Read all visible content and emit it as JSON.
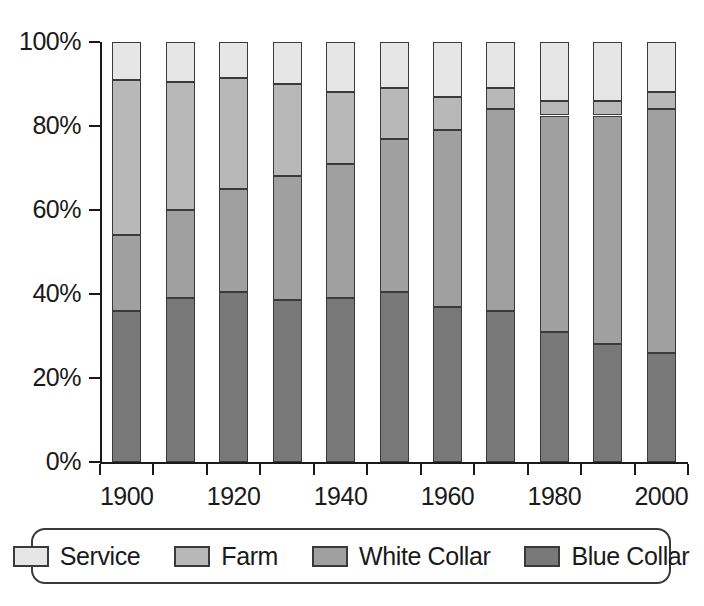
{
  "chart_data": {
    "type": "bar",
    "subtype": "stacked-100-percent",
    "title": "",
    "xlabel": "",
    "ylabel": "",
    "categories": [
      "1900",
      "1910",
      "1920",
      "1930",
      "1940",
      "1950",
      "1960",
      "1970",
      "1980",
      "1990",
      "2000"
    ],
    "x_tick_labels": [
      "1900",
      "",
      "1920",
      "",
      "1940",
      "",
      "1960",
      "",
      "1980",
      "",
      "2000"
    ],
    "y_tick_labels": [
      "0%",
      "20%",
      "40%",
      "60%",
      "80%",
      "100%"
    ],
    "y_tick_values": [
      0,
      20,
      40,
      60,
      80,
      100
    ],
    "ylim": [
      0,
      100
    ],
    "grid": false,
    "legend_position": "bottom",
    "stack_order_bottom_to_top": [
      "Blue Collar",
      "White Collar",
      "Farm",
      "Service"
    ],
    "series": [
      {
        "name": "Blue Collar",
        "color": "#787878",
        "values": [
          36,
          39,
          40.5,
          38.5,
          39,
          40.5,
          37,
          36,
          31,
          28,
          26
        ]
      },
      {
        "name": "White Collar",
        "color": "#a0a0a0",
        "values": [
          18,
          21,
          24.5,
          29.5,
          32,
          36.5,
          42,
          48,
          51.5,
          54.5,
          58
        ]
      },
      {
        "name": "Farm",
        "color": "#b8b8b8",
        "values": [
          37,
          30.5,
          26.5,
          22,
          17,
          12,
          8,
          5,
          3.5,
          3.5,
          4
        ]
      },
      {
        "name": "Service",
        "color": "#e6e6e6",
        "values": [
          9,
          9.5,
          8.5,
          10,
          12,
          11,
          13,
          11,
          14,
          14,
          12
        ]
      }
    ],
    "cumulative_tops": [
      [
        36,
        54,
        91,
        100
      ],
      [
        39,
        60,
        90.5,
        100
      ],
      [
        40.5,
        65,
        91.5,
        100
      ],
      [
        38.5,
        68,
        90,
        100
      ],
      [
        39,
        71,
        88,
        100
      ],
      [
        40.5,
        77,
        89,
        100
      ],
      [
        37,
        79,
        87,
        100
      ],
      [
        36,
        84,
        89,
        100
      ],
      [
        31,
        82.5,
        86,
        100
      ],
      [
        28,
        82.5,
        86,
        100
      ],
      [
        26,
        84,
        88,
        100
      ]
    ]
  },
  "legend": {
    "items": [
      {
        "label": "Service",
        "color": "#e6e6e6"
      },
      {
        "label": "Farm",
        "color": "#b8b8b8"
      },
      {
        "label": "White Collar",
        "color": "#a0a0a0"
      },
      {
        "label": "Blue Collar",
        "color": "#787878"
      }
    ]
  },
  "axis_colors": {
    "axis_line": "#1a1a1a",
    "bar_outline": "#3a3a3a",
    "background": "#ffffff"
  }
}
